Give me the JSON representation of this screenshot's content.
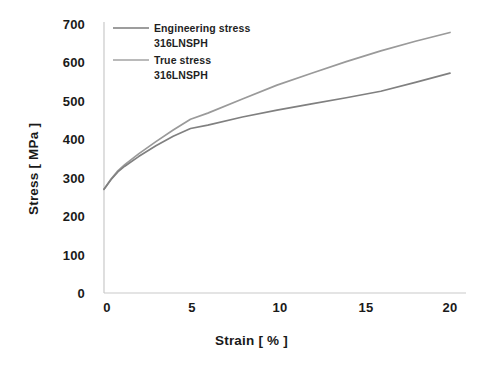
{
  "chart_data": {
    "type": "line",
    "title": "",
    "xlabel": "Strain [ % ]",
    "ylabel": "Stress [ MPa ]",
    "xlim": [
      0,
      20
    ],
    "ylim": [
      0,
      700
    ],
    "xticks": [
      "0",
      "5",
      "10",
      "15",
      "20"
    ],
    "yticks": [
      "0",
      "100",
      "200",
      "300",
      "400",
      "500",
      "600",
      "700"
    ],
    "grid": false,
    "legend_position": "upper-left inside",
    "series": [
      {
        "name": "Engineering stress 316LNSPH",
        "legend_line1": "Engineering stress",
        "legend_line2": "316LNSPH",
        "color": "#808080",
        "x": [
          0.0,
          0.4,
          0.8,
          1.2,
          2.0,
          3.0,
          4.0,
          5.0,
          6.0,
          8.0,
          10.0,
          12.0,
          14.0,
          16.0,
          18.0,
          20.0
        ],
        "y": [
          270,
          295,
          315,
          330,
          355,
          383,
          408,
          428,
          437,
          458,
          476,
          492,
          508,
          525,
          548,
          572
        ]
      },
      {
        "name": "True stress 316LNSPH",
        "legend_line1": "True stress",
        "legend_line2": "316LNSPH",
        "color": "#9a9a9a",
        "x": [
          0.0,
          0.4,
          0.8,
          1.2,
          2.0,
          3.0,
          4.0,
          5.0,
          6.0,
          8.0,
          10.0,
          12.0,
          14.0,
          16.0,
          18.0,
          20.0
        ],
        "y": [
          270,
          296,
          318,
          334,
          362,
          394,
          424,
          452,
          468,
          505,
          541,
          572,
          602,
          630,
          655,
          678
        ]
      }
    ]
  },
  "axes": {
    "y_label": "Stress [ MPa ]",
    "x_label": "Strain [ % ]"
  }
}
